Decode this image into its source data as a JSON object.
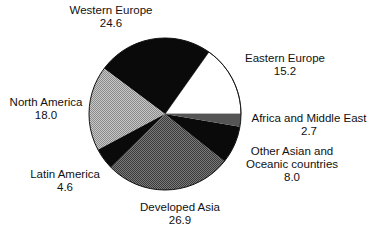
{
  "chart_data": {
    "type": "pie",
    "title": "",
    "start_angle_deg": 0,
    "direction": "counterclockwise",
    "total": 100.0,
    "slices": [
      {
        "label": "Eastern Europe",
        "value": 15.2,
        "value_text": "15.2",
        "fill": "white"
      },
      {
        "label": "Western Europe",
        "value": 24.6,
        "value_text": "24.6",
        "fill": "black"
      },
      {
        "label": "North America",
        "value": 18.0,
        "value_text": "18.0",
        "fill": "light-dots"
      },
      {
        "label": "Latin America",
        "value": 4.6,
        "value_text": "4.6",
        "fill": "black"
      },
      {
        "label": "Developed Asia",
        "value": 26.9,
        "value_text": "26.9",
        "fill": "dark-dots"
      },
      {
        "label": "Other Asian and Oceanic countries",
        "value": 8.0,
        "value_text": "8.0",
        "fill": "black"
      },
      {
        "label": "Africa and Middle East",
        "value": 2.7,
        "value_text": "2.7",
        "fill": "dark-gray"
      }
    ]
  },
  "labels": {
    "western_europe": {
      "name": "Western Europe",
      "value": "24.6"
    },
    "eastern_europe": {
      "name": "Eastern Europe",
      "value": "15.2"
    },
    "north_america": {
      "name": "North America",
      "value": "18.0"
    },
    "africa_middle_east": {
      "name": "Africa and Middle East",
      "value": "2.7"
    },
    "other_asian": {
      "name_line1": "Other Asian and",
      "name_line2": "Oceanic countries",
      "value": "8.0"
    },
    "latin_america": {
      "name": "Latin America",
      "value": "4.6"
    },
    "developed_asia": {
      "name": "Developed Asia",
      "value": "26.9"
    }
  },
  "colors": {
    "black": "#0a0a0a",
    "white": "#ffffff",
    "light_dots_bg": "#c8c8c8",
    "light_dots_fg": "#8a8a8a",
    "dark_dots_bg": "#777777",
    "dark_dots_fg": "#3a3a3a",
    "dark_gray": "#555555",
    "outline": "#111111"
  }
}
